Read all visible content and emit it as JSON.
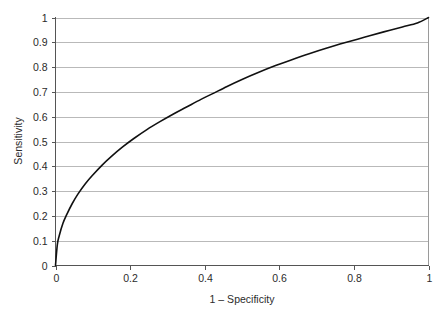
{
  "chart_data": {
    "type": "line",
    "title": "",
    "subtitle": "",
    "xlabel": "1 – Specificity",
    "ylabel": "Sensitivity",
    "xlim": [
      0,
      1
    ],
    "ylim": [
      0,
      1
    ],
    "grid": "horizontal",
    "legend": "none",
    "x_tick_labels": [
      "0",
      "0.2",
      "0.4",
      "0.6",
      "0.8",
      "1"
    ],
    "x_tick_values": [
      0,
      0.2,
      0.4,
      0.6,
      0.8,
      1
    ],
    "y_tick_labels": [
      "0",
      "0.1",
      "0.2",
      "0.3",
      "0.4",
      "0.5",
      "0.6",
      "0.7",
      "0.8",
      "0.9",
      "1"
    ],
    "y_tick_values": [
      0,
      0.1,
      0.2,
      0.3,
      0.4,
      0.5,
      0.6,
      0.7,
      0.8,
      0.9,
      1
    ],
    "series": [
      {
        "name": "ROC curve",
        "color": "#111111",
        "x": [
          0.0,
          0.005,
          0.01,
          0.02,
          0.03,
          0.045,
          0.06,
          0.08,
          0.1,
          0.125,
          0.15,
          0.18,
          0.21,
          0.245,
          0.28,
          0.315,
          0.35,
          0.39,
          0.42,
          0.46,
          0.5,
          0.545,
          0.59,
          0.63,
          0.68,
          0.73,
          0.78,
          0.83,
          0.88,
          0.93,
          0.97,
          1.0
        ],
        "y": [
          0.0,
          0.085,
          0.12,
          0.17,
          0.205,
          0.25,
          0.288,
          0.33,
          0.365,
          0.405,
          0.44,
          0.478,
          0.512,
          0.548,
          0.58,
          0.61,
          0.638,
          0.67,
          0.692,
          0.722,
          0.75,
          0.779,
          0.806,
          0.828,
          0.854,
          0.878,
          0.9,
          0.921,
          0.942,
          0.962,
          0.978,
          1.0
        ]
      }
    ]
  },
  "axes": {
    "y_axis_title": "Sensitivity",
    "x_axis_title": "1 – Specificity"
  },
  "colors": {
    "curve": "#111111",
    "gridline": "#b9b9b9",
    "axis": "#555555",
    "frame": "#9a9a9a",
    "background": "#ffffff",
    "text": "#2b2b2b"
  }
}
